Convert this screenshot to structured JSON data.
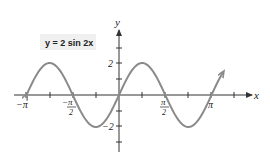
{
  "chart_data": {
    "type": "line",
    "title": "y = 2 sin 2x",
    "xlabel": "x",
    "ylabel": "y",
    "function": "y = 2*sin(2*x)",
    "xlim": [
      -3.14159,
      3.14159
    ],
    "ylim": [
      -3,
      3
    ],
    "x_ticks": [
      {
        "value": -3.14159,
        "label": "−π"
      },
      {
        "value": -1.5708,
        "label": "−π/2"
      },
      {
        "value": 1.5708,
        "label": "π/2"
      },
      {
        "value": 3.14159,
        "label": "π"
      }
    ],
    "x_minor_ticks": [
      -2.356,
      -0.785,
      0.785,
      2.356,
      3.927
    ],
    "y_ticks": [
      {
        "value": 2,
        "label": "2"
      },
      {
        "value": -2,
        "label": "−2"
      }
    ],
    "y_minor_ticks": [
      1,
      -1,
      3,
      -3
    ],
    "grid": false,
    "series": [
      {
        "name": "y = 2 sin 2x",
        "color": "#8a8a8a",
        "x": [
          -3.1416,
          -2.3562,
          -1.5708,
          -0.7854,
          0,
          0.7854,
          1.5708,
          2.3562,
          3.1416,
          3.53
        ],
        "values": [
          0,
          2,
          0,
          -2,
          0,
          2,
          0,
          -2,
          0,
          1.4
        ]
      }
    ],
    "annotations": [
      {
        "text": "y = 2 sin 2x",
        "position": "upper-left"
      }
    ]
  },
  "labels": {
    "title": "y = 2 sin 2x",
    "x_axis": "x",
    "y_axis": "y",
    "x_neg_pi": "−π",
    "x_neg_half_pi_num": "−π",
    "x_neg_half_pi_den": "2",
    "x_half_pi_num": "π",
    "x_half_pi_den": "2",
    "x_pi": "π",
    "y_two": "2",
    "y_neg_two": "−2"
  },
  "colors": {
    "curve": "#8a8a8a",
    "axis": "#333333"
  }
}
